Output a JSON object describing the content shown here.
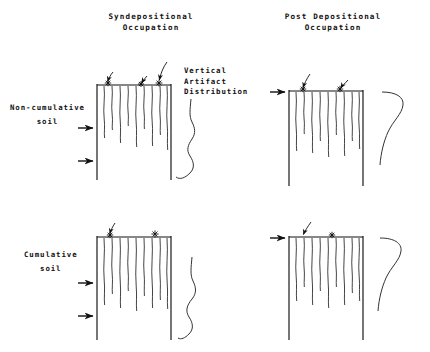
{
  "figure": {
    "title_hidden": "",
    "background": "#ffffff",
    "ink": "#1a1a1a",
    "width": 430,
    "height": 352
  },
  "column_headings": [
    {
      "id": "syndepositional",
      "line1": "Syndepositional",
      "line2": "Occupation"
    },
    {
      "id": "post-depositional",
      "line1": "Post Depositional",
      "line2": "Occupation"
    }
  ],
  "row_labels": [
    {
      "id": "non-cumulative-soil",
      "line1": "Non-cumulative",
      "line2": "soil"
    },
    {
      "id": "cumulative-soil",
      "line1": "Cumulative",
      "line2": "soil"
    }
  ],
  "curve_caption": {
    "line1": "Vertical",
    "line2": "Artifact",
    "line3": "Distribution"
  },
  "panels": [
    {
      "id": "syndepositional-non-cumulative",
      "column": "Syndepositional",
      "row": "Non-cumulative soil",
      "profile_box": {
        "x": 96,
        "y": 84,
        "w": 76,
        "h": 96
      },
      "artifact_traces": 9,
      "surface_markers": [
        "asterisk",
        "asterisk",
        "asterisk"
      ],
      "pointer_arrows": [
        "curved-arrow",
        "curved-arrow",
        "curved-arrow"
      ],
      "horizon_arrows": 2,
      "distribution_curve": "sinuous-dispersed"
    },
    {
      "id": "post-depositional-non-cumulative",
      "column": "Post Depositional",
      "row": "Non-cumulative soil",
      "profile_box": {
        "x": 288,
        "y": 90,
        "w": 76,
        "h": 96
      },
      "artifact_traces": 9,
      "surface_markers": [
        "asterisk",
        "asterisk"
      ],
      "pointer_arrows": [
        "curved-arrow",
        "curved-arrow"
      ],
      "horizon_arrows": 1,
      "distribution_curve": "hook-surface-peak"
    },
    {
      "id": "syndepositional-cumulative",
      "column": "Syndepositional",
      "row": "Cumulative soil",
      "profile_box": {
        "x": 96,
        "y": 236,
        "w": 76,
        "h": 104
      },
      "artifact_traces": 9,
      "surface_markers": [
        "asterisk",
        "asterisk"
      ],
      "pointer_arrows": [
        "curved-arrow"
      ],
      "horizon_arrows": 2,
      "distribution_curve": "sinuous-dispersed"
    },
    {
      "id": "post-depositional-cumulative",
      "column": "Post Depositional",
      "row": "Cumulative soil",
      "profile_box": {
        "x": 288,
        "y": 236,
        "w": 76,
        "h": 104
      },
      "artifact_traces": 9,
      "surface_markers": [
        "asterisk"
      ],
      "pointer_arrows": [
        "curved-arrow"
      ],
      "horizon_arrows": 1,
      "distribution_curve": "hook-surface-peak"
    }
  ],
  "legend_semantics": {
    "solid_arrow": "soil horizon boundary marker",
    "asterisk": "surface artifact",
    "wavy_vertical_line": "vertical artifact migration trace"
  }
}
